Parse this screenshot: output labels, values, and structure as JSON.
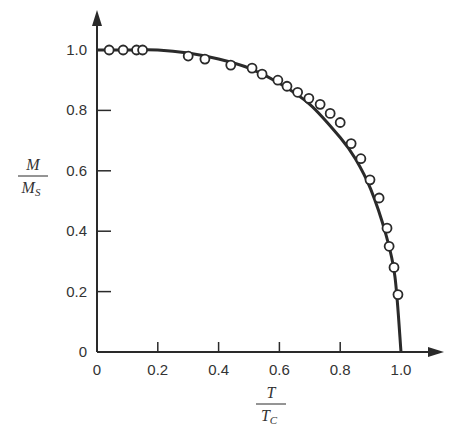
{
  "chart_data": {
    "type": "scatter",
    "title": "",
    "xlabel": "T / T_C",
    "ylabel": "M / M_S",
    "xlabel_parts": {
      "num": "T",
      "den": "T",
      "den_sub": "C"
    },
    "ylabel_parts": {
      "num": "M",
      "den": "M",
      "den_sub": "S"
    },
    "xlim": [
      0,
      1.1
    ],
    "ylim": [
      0,
      1.1
    ],
    "grid": false,
    "legend": "none",
    "x_ticks": [
      0,
      0.2,
      0.4,
      0.6,
      0.8,
      1.0
    ],
    "x_tick_labels": [
      "0",
      "0.2",
      "0.4",
      "0.6",
      "0.8",
      "1.0"
    ],
    "y_ticks": [
      0,
      0.2,
      0.4,
      0.6,
      0.8,
      1.0
    ],
    "y_tick_labels": [
      "0",
      "0.2",
      "0.4",
      "0.6",
      "0.8",
      "1.0"
    ],
    "series": [
      {
        "name": "theory curve",
        "style": "solid line",
        "x": [
          0,
          0.1,
          0.2,
          0.3,
          0.4,
          0.5,
          0.6,
          0.7,
          0.8,
          0.85,
          0.9,
          0.95,
          0.98,
          1.0
        ],
        "y": [
          1.0,
          1.0,
          1.0,
          0.99,
          0.97,
          0.94,
          0.89,
          0.82,
          0.71,
          0.64,
          0.54,
          0.39,
          0.25,
          0.0
        ]
      },
      {
        "name": "measured",
        "style": "open circles",
        "x": [
          0.04,
          0.086,
          0.13,
          0.15,
          0.3,
          0.355,
          0.44,
          0.51,
          0.543,
          0.595,
          0.625,
          0.66,
          0.697,
          0.734,
          0.767,
          0.8,
          0.836,
          0.868,
          0.898,
          0.928,
          0.954,
          0.961,
          0.977,
          0.99
        ],
        "y": [
          1.0,
          1.0,
          1.0,
          1.0,
          0.98,
          0.97,
          0.95,
          0.94,
          0.92,
          0.9,
          0.88,
          0.86,
          0.84,
          0.82,
          0.79,
          0.76,
          0.69,
          0.64,
          0.57,
          0.51,
          0.41,
          0.35,
          0.28,
          0.19
        ]
      }
    ]
  }
}
